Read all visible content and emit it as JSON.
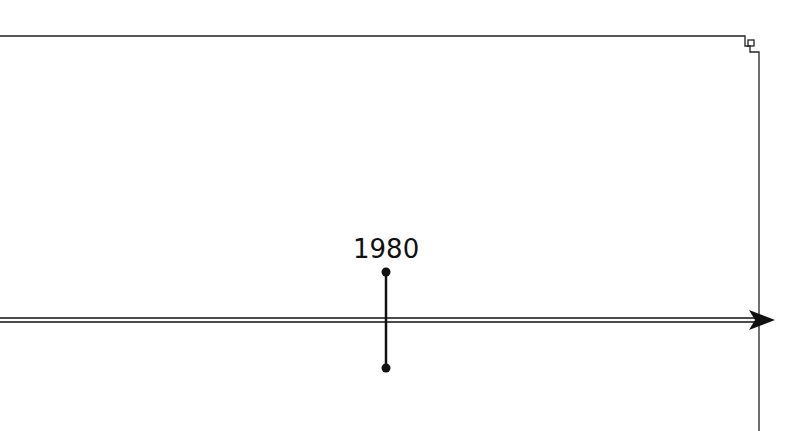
{
  "diagram": {
    "type": "timeline",
    "events": [
      {
        "label": "1980",
        "x": 386
      }
    ],
    "colors": {
      "line": "#111111",
      "frame": "#222222",
      "background": "#ffffff"
    }
  }
}
